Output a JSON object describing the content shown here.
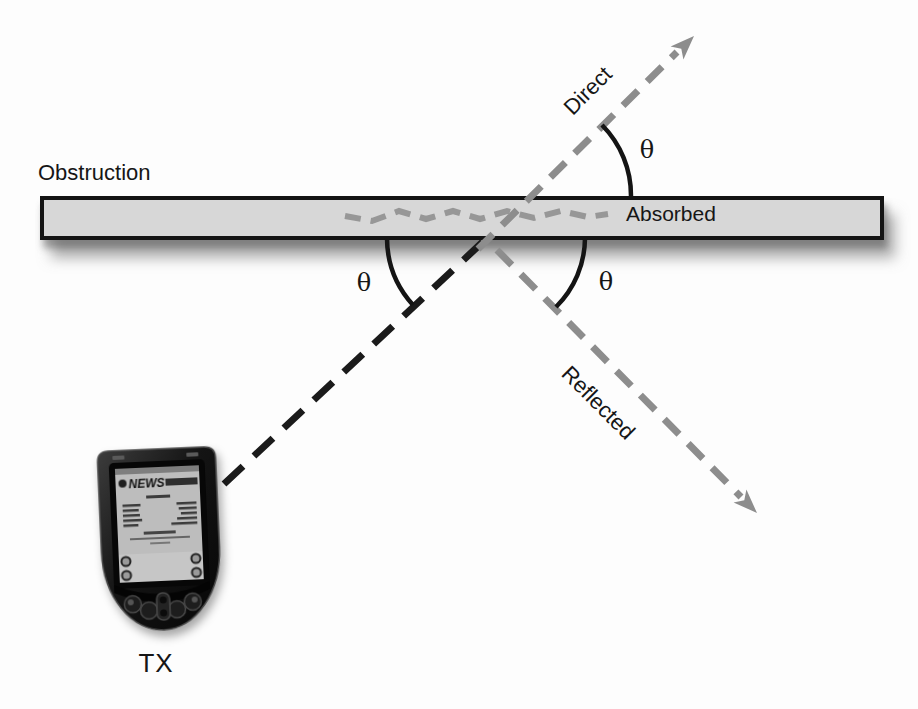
{
  "figure": {
    "labels": {
      "obstruction": "Obstruction",
      "absorbed": "Absorbed",
      "direct": "Direct",
      "reflected": "Reflected",
      "transmitter": "TX",
      "theta": "θ"
    },
    "device_screen": {
      "title": "NEWS"
    },
    "colors": {
      "background": "#fdfdfd",
      "obstruction_fill": "#d7d7d7",
      "obstruction_border": "#141414",
      "incident_ray": "#1b1b1b",
      "secondary_rays": "#8d8d8d",
      "absorbed_wave": "#979797",
      "angle_arcs": "#141414",
      "text": "#161616"
    }
  }
}
